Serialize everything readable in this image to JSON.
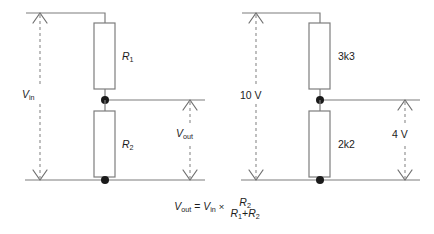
{
  "figure": {
    "type": "schematic",
    "line_color": "#7d7d7d",
    "dash_color": "#8a8a8a",
    "node_color": "#1a1a1a",
    "text_color": "#1c1c1c",
    "background": "#ffffff"
  },
  "circuits": [
    {
      "id": "symbolic-divider",
      "supply": {
        "label_text": "V",
        "label_sub": "in",
        "measurement": "Vin",
        "arrow_style": "dashed-double-headed-vertical"
      },
      "resistors": [
        {
          "ref": "top",
          "label_text": "R",
          "label_sub": "1",
          "value": "R1"
        },
        {
          "ref": "bottom",
          "label_text": "R",
          "label_sub": "2",
          "value": "R2"
        }
      ],
      "output": {
        "label_text": "V",
        "label_sub": "out",
        "measurement": "Vout",
        "arrow_style": "dashed-double-headed-vertical"
      }
    },
    {
      "id": "worked-example-divider",
      "supply": {
        "label_text": "10 V",
        "label_sub": "",
        "measurement": "10 V",
        "arrow_style": "dashed-double-headed-vertical"
      },
      "resistors": [
        {
          "ref": "top",
          "label_text": "3k3",
          "label_sub": "",
          "value": "3k3"
        },
        {
          "ref": "bottom",
          "label_text": "2k2",
          "label_sub": "",
          "value": "2k2"
        }
      ],
      "output": {
        "label_text": "4 V",
        "label_sub": "",
        "measurement": "4 V",
        "arrow_style": "dashed-double-headed-vertical"
      }
    }
  ],
  "formula": {
    "lhs_sym": "V",
    "lhs_sub": "out",
    "equals": "=",
    "rhs_sym": "V",
    "rhs_sub": "in",
    "times": "×",
    "numerator_sym": "R",
    "numerator_sub": "2",
    "denominator_first_sym": "R",
    "denominator_first_sub": "1",
    "denominator_plus": "+",
    "denominator_second_sym": "R",
    "denominator_second_sub": "2"
  }
}
